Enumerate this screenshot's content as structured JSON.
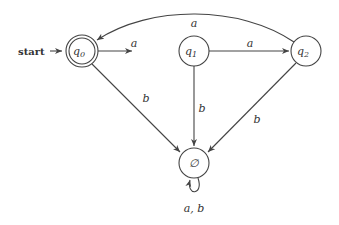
{
  "diagram": {
    "type": "DFA",
    "start_label": "start",
    "states": [
      {
        "id": "q0",
        "name": "q",
        "sub": "0",
        "accepting": true,
        "initial": true
      },
      {
        "id": "q1",
        "name": "q",
        "sub": "1",
        "accepting": false
      },
      {
        "id": "q2",
        "name": "q",
        "sub": "2",
        "accepting": false
      },
      {
        "id": "empty",
        "name": "∅",
        "sub": "",
        "accepting": false
      }
    ],
    "transitions": [
      {
        "from": "q0",
        "to": "q1",
        "label": "a"
      },
      {
        "from": "q1",
        "to": "q2",
        "label": "a"
      },
      {
        "from": "q2",
        "to": "q0",
        "label": "a"
      },
      {
        "from": "q0",
        "to": "empty",
        "label": "b"
      },
      {
        "from": "q1",
        "to": "empty",
        "label": "b"
      },
      {
        "from": "q2",
        "to": "empty",
        "label": "b"
      },
      {
        "from": "empty",
        "to": "empty",
        "label": "a, b"
      }
    ]
  }
}
